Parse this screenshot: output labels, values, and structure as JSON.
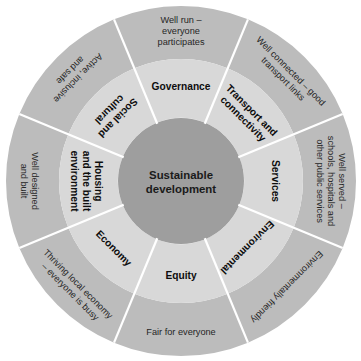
{
  "diagram": {
    "core": {
      "label_line1": "Sustainable",
      "label_line2": "development"
    },
    "colors": {
      "outer_ring": "#bcbcbc",
      "middle_ring": "#d8d8d8",
      "core_circle": "#9e9e9e",
      "divider": "#ffffff",
      "background": "#ffffff",
      "text": "#1a1a1a"
    },
    "geometry": {
      "center_x": 181,
      "center_y": 181,
      "outer_radius": 175,
      "middle_radius": 122,
      "core_radius": 63,
      "segment_count": 8,
      "segment_degrees": 45
    },
    "segments": [
      {
        "id": "governance",
        "category": "Governance",
        "category_lines": [
          "Governance"
        ],
        "description": "Well run – everyone participates",
        "description_lines": [
          "Well run –",
          "everyone",
          "participates"
        ],
        "center_angle_deg": 270,
        "orientation": "horizontal"
      },
      {
        "id": "transport-and-connectivity",
        "category": "Transport and connectivity",
        "category_lines": [
          "Transport and",
          "connectivity"
        ],
        "description": "Well connected – good transport links",
        "description_lines": [
          "Well connected – good",
          "transport links"
        ],
        "center_angle_deg": 315,
        "orientation": "radial"
      },
      {
        "id": "services",
        "category": "Services",
        "category_lines": [
          "Services"
        ],
        "description": "Well served – schools, hospitals and other public services",
        "description_lines": [
          "Well served –",
          "schools, hospitals and",
          "other public services"
        ],
        "center_angle_deg": 0,
        "orientation": "radial"
      },
      {
        "id": "environmental",
        "category": "Environmental",
        "category_lines": [
          "Environmental"
        ],
        "description": "Environmentally friendly",
        "description_lines": [
          "Environmentally friendly"
        ],
        "center_angle_deg": 45,
        "orientation": "radial"
      },
      {
        "id": "equity",
        "category": "Equity",
        "category_lines": [
          "Equity"
        ],
        "description": "Fair for everyone",
        "description_lines": [
          "Fair for everyone"
        ],
        "center_angle_deg": 90,
        "orientation": "horizontal"
      },
      {
        "id": "economy",
        "category": "Economy",
        "category_lines": [
          "Economy"
        ],
        "description": "Thriving local economy – everyone is busy",
        "description_lines": [
          "Thriving local economy",
          "– everyone is busy"
        ],
        "center_angle_deg": 135,
        "orientation": "radial"
      },
      {
        "id": "housing-and-the-built-environment",
        "category": "Housing and the built environment",
        "category_lines": [
          "Housing",
          "and the built",
          "environment"
        ],
        "description": "Well designed and built",
        "description_lines": [
          "Well designed",
          "and built"
        ],
        "center_angle_deg": 180,
        "orientation": "radial"
      },
      {
        "id": "social-and-cultural",
        "category": "Social and cultural",
        "category_lines": [
          "Social and",
          "cultural"
        ],
        "description": "Active, inclusive and safe",
        "description_lines": [
          "Active, inclusive",
          "and safe"
        ],
        "center_angle_deg": 225,
        "orientation": "radial"
      }
    ]
  }
}
